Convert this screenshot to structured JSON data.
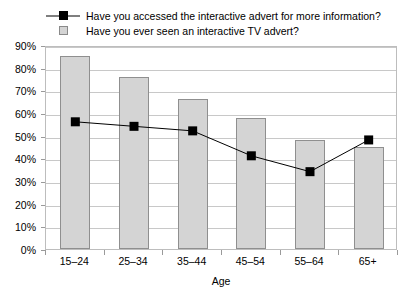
{
  "chart_data": {
    "type": "bar",
    "title": "",
    "xlabel": "Age",
    "ylabel": "",
    "categories": [
      "15–24",
      "25–34",
      "35–44",
      "45–54",
      "55–64",
      "65+"
    ],
    "ylim": [
      0,
      90
    ],
    "ytick_step": 10,
    "ytick_labels": [
      "0%",
      "10%",
      "20%",
      "30%",
      "40%",
      "50%",
      "60%",
      "70%",
      "80%",
      "90%"
    ],
    "grid": true,
    "legend_position": "top-left",
    "series": [
      {
        "name": "Have you accessed the interactive advert for more information?",
        "type": "line",
        "marker": "square",
        "color": "#000000",
        "values": [
          57,
          55,
          53,
          42,
          35,
          49
        ]
      },
      {
        "name": "Have you ever seen an interactive TV advert?",
        "type": "bar",
        "color": "#d4d4d4",
        "border_color": "#8f8f8f",
        "values": [
          85,
          76,
          66,
          58,
          48,
          45
        ]
      }
    ]
  },
  "legend": {
    "items": [
      {
        "label": "Have you accessed the interactive advert for more information?",
        "key": "line-square-marker"
      },
      {
        "label": "Have you ever seen an interactive TV advert?",
        "key": "gray-square-swatch"
      }
    ]
  },
  "axes": {
    "x_title": "Age"
  }
}
